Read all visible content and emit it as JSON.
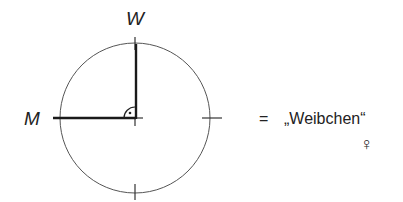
{
  "diagram": {
    "axis_labels": {
      "top": "W",
      "left": "M"
    },
    "legend": {
      "equals": "=",
      "text": "„Weibchen“",
      "symbol": "♀"
    },
    "colors": {
      "circle": "#555555",
      "axis": "#1a1a1a",
      "text": "#222222"
    }
  }
}
